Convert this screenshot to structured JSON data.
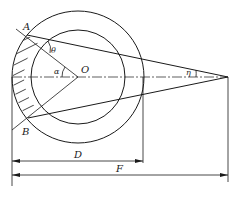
{
  "diagram": {
    "type": "geometry",
    "labels": {
      "point_a": "A",
      "point_b": "B",
      "center": "O",
      "angle_theta": "θ",
      "angle_alpha": "α",
      "angle_eta": "η",
      "dim_d": "D",
      "dim_f": "F"
    },
    "colors": {
      "stroke": "#1a1a1a",
      "background": "#ffffff"
    }
  }
}
